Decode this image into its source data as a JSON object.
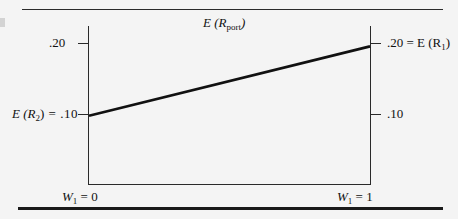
{
  "figure": {
    "title": "E (R",
    "title_sub": "port",
    "title_tail": ")"
  },
  "axes": {
    "left": {
      "ticks": [
        {
          "value": ".20",
          "label": ".20"
        },
        {
          "value": ".10",
          "label": ".10"
        }
      ],
      "top_label": ".20",
      "bottom_label_prefix": "E (R",
      "bottom_label_sub": "2",
      "bottom_label_suffix": ") = .10"
    },
    "right": {
      "top_label_prefix": ".20 = E (R",
      "top_label_sub": "1",
      "top_label_suffix": ")",
      "bottom_label": ".10"
    },
    "x": {
      "left_label_prefix": "W",
      "left_label_sub": "1",
      "left_label_suffix": " = 0",
      "right_label_prefix": "W",
      "right_label_sub": "1",
      "right_label_suffix": " = 1"
    }
  },
  "colors": {
    "line": "#111111",
    "axis": "#2a2a2a",
    "rule": "#1a1a1a",
    "background": "#f4f4f4"
  },
  "chart_data": {
    "type": "line",
    "xlabel": "W_1",
    "ylabel": "E (R_port)",
    "x": [
      0,
      1
    ],
    "series": [
      {
        "name": "E (R_port)",
        "values": [
          0.1,
          0.2
        ]
      }
    ],
    "xlim": [
      0,
      1
    ],
    "ylim": [
      0,
      0.2294
    ],
    "xtick_labels": [
      "W_1 = 0",
      "W_1 = 1"
    ],
    "ytick_values_left": [
      0.2,
      0.1
    ],
    "ytick_labels_left": [
      ".20",
      "E (R_2) = .10"
    ],
    "ytick_values_right": [
      0.2,
      0.1
    ],
    "ytick_labels_right": [
      ".20 = E (R_1)",
      ".10"
    ],
    "grid": false,
    "legend": "none",
    "annotations": [
      "E (R_2) = .10 at W_1 = 0",
      ".20 = E (R_1) at W_1 = 1"
    ]
  }
}
